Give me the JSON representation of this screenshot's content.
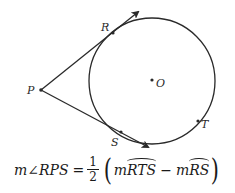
{
  "diagram": {
    "circle": {
      "center_label": "O",
      "cx": 152,
      "cy": 81,
      "r": 63
    },
    "points": [
      {
        "label": "P",
        "x": 41,
        "y": 90,
        "role": "external point"
      },
      {
        "label": "R",
        "x": 113,
        "y": 33,
        "role": "tangent point"
      },
      {
        "label": "S",
        "x": 121,
        "y": 132,
        "role": "tangent point"
      },
      {
        "label": "T",
        "x": 198,
        "y": 121,
        "role": "point on major arc"
      },
      {
        "label": "O",
        "x": 152,
        "y": 80,
        "role": "center"
      }
    ],
    "rays": [
      {
        "from": "P",
        "through": "R",
        "arrow": true
      },
      {
        "from": "P",
        "through": "S",
        "arrow": true
      }
    ],
    "colors": {
      "stroke": "#2a2a2a",
      "background": "#ffffff"
    }
  },
  "formula": {
    "lhs_m": "m",
    "angle_symbol": "∠",
    "angle_name": "RPS",
    "equals": "=",
    "frac_num": "1",
    "frac_den": "2",
    "open_paren": "(",
    "term1_m": "m",
    "term1_arc": "RTS",
    "minus": "−",
    "term2_m": "m",
    "term2_arc": "RS",
    "close_paren": ")"
  }
}
